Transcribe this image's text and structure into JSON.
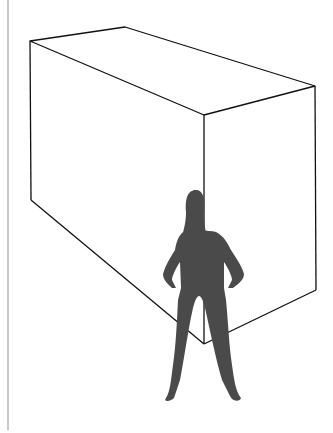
{
  "diagram": {
    "colors": {
      "background": "#ffffff",
      "box_stroke": "#111111",
      "silhouette": "#4a4a4a",
      "margin_line": "#c8c8c8"
    },
    "box": {
      "vertices": {
        "top_left": [
          30,
          41
        ],
        "top_back": [
          125,
          27
        ],
        "top_right": [
          315,
          86
        ],
        "top_front": [
          204,
          115
        ],
        "bottom_left": [
          31,
          200
        ],
        "bottom_right": [
          316,
          290
        ],
        "bottom_front": [
          204,
          344
        ]
      }
    },
    "figure": {
      "label": "person-silhouette",
      "bounds": [
        163,
        190,
        245,
        400
      ]
    }
  }
}
